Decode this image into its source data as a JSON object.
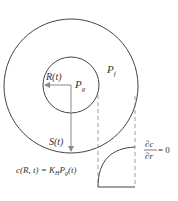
{
  "diagram": {
    "labels": {
      "inner_radius": "R(t)",
      "gas_pressure": "P",
      "gas_pressure_sub": "g",
      "liquid_pressure": "P",
      "liquid_pressure_sub": "f",
      "shell_radius": "S(t)",
      "boundary_condition_inner": "c(R, t) = K",
      "boundary_condition_inner_K_sub": "H",
      "boundary_condition_inner_P": "P",
      "boundary_condition_inner_P_sub": "g",
      "boundary_condition_inner_tail": "(t)",
      "bc_outer_num": "∂c",
      "bc_outer_den": "∂r",
      "bc_outer_rhs": "= 0"
    },
    "colors": {
      "stroke": "#444444",
      "arrow": "#8a8a8a",
      "dashed": "#888888"
    }
  }
}
